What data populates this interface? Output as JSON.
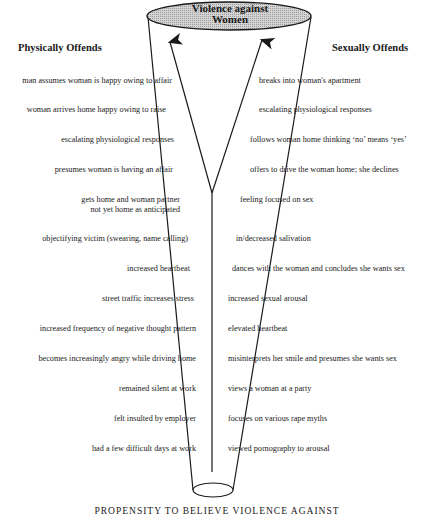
{
  "diagram": {
    "apex_label": "Violence against Women",
    "apex_label_line1": "Violence against",
    "apex_label_line2": "Women",
    "footer": "PROPENSITY TO BELIEVE VIOLENCE AGAINST",
    "colors": {
      "ellipse_fill": "#c8c8c8",
      "line": "#1a1a1a",
      "background": "#ffffff"
    },
    "left": {
      "heading": "Physically Offends",
      "items": [
        "man assumes woman is happy owing to affair",
        "woman arrives home happy owing to raise",
        "escalating physiological responses",
        "presumes woman is having an affair",
        "gets home and woman partner",
        "not yet home as anticipated",
        "objectifying victim (swearing, name calling)",
        "increased heartbeat",
        "street traffic increases stress",
        "increased frequency of negative thought pattern",
        "becomes increasingly angry while driving home",
        "remained silent at work",
        "felt insulted by employer",
        "had a few difficult days at work"
      ]
    },
    "right": {
      "heading": "Sexually Offends",
      "items": [
        "breaks into woman's apartment",
        "escalating physiological responses",
        "follows woman home thinking ‘no’ means ‘yes’",
        "offers to drive the woman home; she declines",
        "feeling focused on sex",
        "in/decreased salivation",
        "dances with the woman and concludes she wants sex",
        "increased sexual arousal",
        "elevated heartbeat",
        "misinterprets her smile and presumes she wants sex",
        "views a woman at a party",
        "focuses on various rape myths",
        "viewed pornography to arousal"
      ]
    }
  }
}
